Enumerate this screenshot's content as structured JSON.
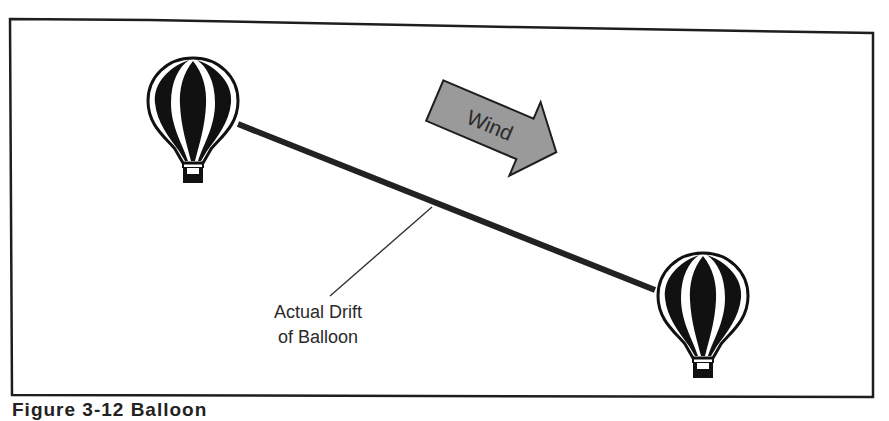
{
  "figure": {
    "caption": "Figure 3-12  Balloon"
  },
  "labels": {
    "wind": "Wind",
    "drift_line1": "Actual Drift",
    "drift_line2": "of Balloon"
  },
  "colors": {
    "frame": "#1e1e1e",
    "balloon": "#111111",
    "drift_line": "#222222",
    "wind_arrow_fill": "#9a9a9a",
    "wind_arrow_stroke": "#1e1e1e",
    "text": "#2a2a2a"
  },
  "elements": {
    "balloon_start": {
      "cx": 193,
      "cy": 105
    },
    "balloon_end": {
      "cx": 703,
      "cy": 300
    },
    "drift_path": {
      "x1": 238,
      "y1": 124,
      "x2": 655,
      "y2": 290
    },
    "leader_line": {
      "x1": 330,
      "y1": 296,
      "x2": 432,
      "y2": 207
    }
  }
}
